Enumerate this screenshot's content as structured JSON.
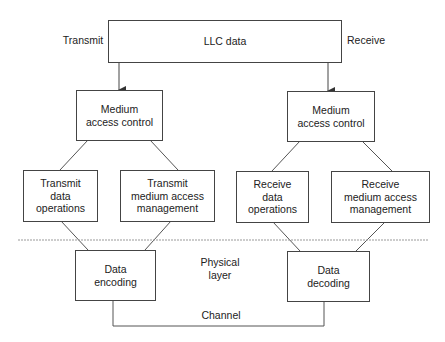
{
  "diagram": {
    "side_labels": {
      "transmit": "Transmit",
      "receive": "Receive"
    },
    "top": {
      "llc": "LLC data"
    },
    "mac": {
      "left": "Medium\naccess control",
      "right": "Medium\naccess control"
    },
    "sublayer": {
      "transmit_data": "Transmit\ndata\noperations",
      "transmit_mgmt": "Transmit\nmedium access\nmanagement",
      "receive_data": "Receive\ndata\noperations",
      "receive_mgmt": "Receive\nmedium access\nmanagement"
    },
    "physical": {
      "encoding": "Data\nencoding",
      "decoding": "Data\ndecoding",
      "layer_label": "Physical\nlayer",
      "channel_label": "Channel"
    },
    "colors": {
      "line": "#444444",
      "dashed": "#999999"
    }
  }
}
